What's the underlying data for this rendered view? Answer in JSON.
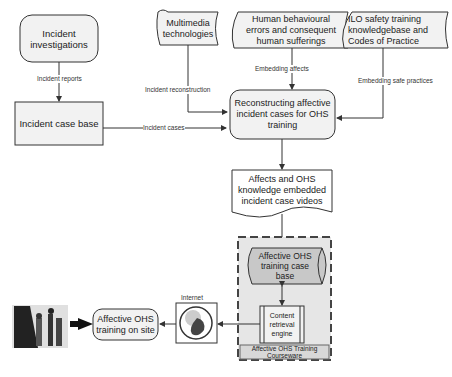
{
  "nodes": {
    "incident_investigations": "Incident\ninvestigations",
    "incident_case_base": "Incident case base",
    "multimedia": "Multimedia\ntechnologies",
    "human_errors": "Human behavioural\nerrors and consequent\nhuman sufferings",
    "ilo": "ILO safety training\nknowledgebase and\nCodes of Practice",
    "reconstructing": "Reconstructing affective\nincident cases for OHS\ntraining",
    "videos": "Affects and OHS\nknowledge embedded\nincident case videos",
    "training_case_base": "Affective OHS\ntraining case\nbase",
    "retrieval_engine": "Content\nretrieval\nengine",
    "courseware": "Affective OHS Training\nCourseware",
    "internet": "Internet",
    "training_on_site": "Affective OHS\ntraining on site"
  },
  "edges": {
    "incident_reports": "Incident reports",
    "incident_reconstruction": "Incident  reconstruction",
    "incident_cases": "Incident cases",
    "embedding_affects": "Embedding affects",
    "embedding_safe_practices": "Embedding safe practices"
  },
  "colors": {
    "box_fill": "#f2f2f2",
    "cylinder_fill": "#c8c8c8",
    "courseware_fill": "#dcdcdc",
    "stroke": "#333333"
  }
}
